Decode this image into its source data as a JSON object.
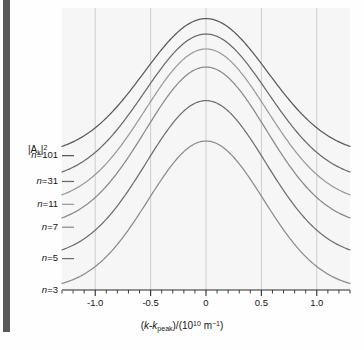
{
  "figure": {
    "background": "#fefefe",
    "plot_background": "#f7f7f7",
    "gutter_color": "#595959"
  },
  "axes": {
    "ylabel_parts": {
      "pre": "|A",
      "sub": "k",
      "post": "|",
      "sup": "2"
    },
    "xlabel_parts": {
      "p1": "(",
      "k1": "k",
      "dash": "-",
      "k2": "k",
      "sub1": "peak",
      "p2": ")/(10",
      "sup1": "10",
      "p3": " m",
      "sup2": "−1",
      "p4": ")"
    }
  },
  "chart_data": {
    "type": "line",
    "title": "",
    "xlabel": "(k-k_peak)/(10^10 m^-1)",
    "ylabel": "|A_k|^2",
    "xlim": [
      -1.3,
      1.3
    ],
    "ylim": [
      0,
      1.06
    ],
    "grid": true,
    "grid_axis": "x",
    "gridline_x": [
      -1.0,
      -0.5,
      0,
      0.5,
      1.0
    ],
    "xticks_major": [
      -1.0,
      -0.5,
      0,
      0.5,
      1.0
    ],
    "xtick_labels": [
      "-1.0",
      "-0.5",
      "0",
      "0.5",
      "1.0"
    ],
    "xticks_minor_step": 0.1,
    "legend_position": "left-outside",
    "series": [
      {
        "name": "n=3",
        "label_parts": {
          "n": "n",
          "eq": "=",
          "value": "3"
        },
        "baseline": 0.0,
        "peak": 0.56,
        "sigma": 0.52,
        "color": "#8c8c8c",
        "x": [
          -1.3,
          -1.2,
          -1.1,
          -1.0,
          -0.9,
          -0.8,
          -0.7,
          -0.6,
          -0.5,
          -0.4,
          -0.3,
          -0.2,
          -0.1,
          0,
          0.1,
          0.2,
          0.3,
          0.4,
          0.5,
          0.6,
          0.7,
          0.8,
          0.9,
          1.0,
          1.1,
          1.2,
          1.3
        ],
        "values": [
          0.012,
          0.02,
          0.033,
          0.052,
          0.079,
          0.115,
          0.161,
          0.216,
          0.278,
          0.344,
          0.409,
          0.467,
          0.512,
          0.539,
          0.512,
          0.467,
          0.409,
          0.344,
          0.278,
          0.216,
          0.161,
          0.115,
          0.079,
          0.052,
          0.033,
          0.02,
          0.012
        ]
      },
      {
        "name": "n=5",
        "label_parts": {
          "n": "n",
          "eq": "=",
          "value": "5"
        },
        "baseline": 0.118,
        "peak": 0.712,
        "sigma": 0.54,
        "color": "#6e6e6e",
        "x": [
          -1.3,
          -1.2,
          -1.1,
          -1.0,
          -0.9,
          -0.8,
          -0.7,
          -0.6,
          -0.5,
          -0.4,
          -0.3,
          -0.2,
          -0.1,
          0,
          0.1,
          0.2,
          0.3,
          0.4,
          0.5,
          0.6,
          0.7,
          0.8,
          0.9,
          1.0,
          1.1,
          1.2,
          1.3
        ],
        "values": [
          0.134,
          0.142,
          0.156,
          0.176,
          0.205,
          0.243,
          0.29,
          0.345,
          0.406,
          0.47,
          0.532,
          0.587,
          0.628,
          0.653,
          0.628,
          0.587,
          0.532,
          0.47,
          0.406,
          0.345,
          0.29,
          0.243,
          0.205,
          0.176,
          0.156,
          0.142,
          0.134
        ]
      },
      {
        "name": "n=7",
        "label_parts": {
          "n": "n",
          "eq": "=",
          "value": "7"
        },
        "baseline": 0.236,
        "peak": 0.838,
        "sigma": 0.545,
        "color": "#8a8a8a",
        "x": [
          -1.3,
          -1.2,
          -1.1,
          -1.0,
          -0.9,
          -0.8,
          -0.7,
          -0.6,
          -0.5,
          -0.4,
          -0.3,
          -0.2,
          -0.1,
          0,
          0.1,
          0.2,
          0.3,
          0.4,
          0.5,
          0.6,
          0.7,
          0.8,
          0.9,
          1.0,
          1.1,
          1.2,
          1.3
        ],
        "values": [
          0.252,
          0.261,
          0.275,
          0.296,
          0.325,
          0.364,
          0.411,
          0.466,
          0.527,
          0.59,
          0.651,
          0.705,
          0.745,
          0.769,
          0.745,
          0.705,
          0.651,
          0.59,
          0.527,
          0.466,
          0.411,
          0.364,
          0.325,
          0.296,
          0.275,
          0.261,
          0.252
        ]
      },
      {
        "name": "n=11",
        "label_parts": {
          "n": "n",
          "eq": "=",
          "value": "11"
        },
        "baseline": 0.322,
        "peak": 0.906,
        "sigma": 0.55,
        "color": "#9a9a9a",
        "x": [
          -1.3,
          -1.2,
          -1.1,
          -1.0,
          -0.9,
          -0.8,
          -0.7,
          -0.6,
          -0.5,
          -0.4,
          -0.3,
          -0.2,
          -0.1,
          0,
          0.1,
          0.2,
          0.3,
          0.4,
          0.5,
          0.6,
          0.7,
          0.8,
          0.9,
          1.0,
          1.1,
          1.2,
          1.3
        ],
        "values": [
          0.338,
          0.347,
          0.361,
          0.382,
          0.411,
          0.45,
          0.497,
          0.551,
          0.611,
          0.673,
          0.733,
          0.785,
          0.823,
          0.846,
          0.823,
          0.785,
          0.733,
          0.673,
          0.611,
          0.551,
          0.497,
          0.45,
          0.411,
          0.382,
          0.361,
          0.347,
          0.338
        ]
      },
      {
        "name": "n=31",
        "label_parts": {
          "n": "n",
          "eq": "=",
          "value": "31"
        },
        "baseline": 0.408,
        "peak": 0.962,
        "sigma": 0.555,
        "color": "#6a6a6a",
        "x": [
          -1.3,
          -1.2,
          -1.1,
          -1.0,
          -0.9,
          -0.8,
          -0.7,
          -0.6,
          -0.5,
          -0.4,
          -0.3,
          -0.2,
          -0.1,
          0,
          0.1,
          0.2,
          0.3,
          0.4,
          0.5,
          0.6,
          0.7,
          0.8,
          0.9,
          1.0,
          1.1,
          1.2,
          1.3
        ],
        "values": [
          0.424,
          0.433,
          0.447,
          0.468,
          0.497,
          0.535,
          0.581,
          0.634,
          0.692,
          0.752,
          0.81,
          0.86,
          0.896,
          0.918,
          0.896,
          0.86,
          0.81,
          0.752,
          0.692,
          0.634,
          0.581,
          0.535,
          0.497,
          0.468,
          0.447,
          0.433,
          0.424
        ]
      },
      {
        "name": "n=101",
        "label_parts": {
          "n": "n",
          "eq": "=",
          "value": "101"
        },
        "baseline": 0.505,
        "peak": 1.02,
        "sigma": 0.56,
        "color": "#5a5a5a",
        "x": [
          -1.3,
          -1.2,
          -1.1,
          -1.0,
          -0.9,
          -0.8,
          -0.7,
          -0.6,
          -0.5,
          -0.4,
          -0.3,
          -0.2,
          -0.1,
          0,
          0.1,
          0.2,
          0.3,
          0.4,
          0.5,
          0.6,
          0.7,
          0.8,
          0.9,
          1.0,
          1.1,
          1.2,
          1.3
        ],
        "values": [
          0.521,
          0.53,
          0.544,
          0.565,
          0.594,
          0.632,
          0.678,
          0.731,
          0.788,
          0.847,
          0.903,
          0.952,
          0.987,
          1.008,
          0.987,
          0.952,
          0.903,
          0.847,
          0.788,
          0.731,
          0.678,
          0.632,
          0.594,
          0.565,
          0.544,
          0.53,
          0.521
        ]
      }
    ]
  }
}
